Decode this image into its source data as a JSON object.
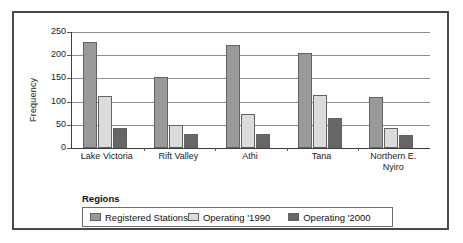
{
  "chart_data": {
    "type": "bar",
    "title": "",
    "subtitle": "",
    "xlabel": "Regions",
    "ylabel": "Frequency",
    "categories": [
      "Lake Victoria",
      "Rift Valley",
      "Athi",
      "Tana",
      "Northern E. Nyiro"
    ],
    "series": [
      {
        "name": "Registered Stations",
        "color": "#999999",
        "values": [
          228,
          152,
          222,
          204,
          111
        ]
      },
      {
        "name": "Operating '1990",
        "color": "#dcdcdc",
        "values": [
          113,
          49,
          73,
          114,
          43
        ]
      },
      {
        "name": "Operating '2000",
        "color": "#666666",
        "values": [
          44,
          31,
          30,
          64,
          27
        ]
      }
    ],
    "ylim": [
      0,
      250
    ],
    "yticks": [
      0,
      50,
      100,
      150,
      200,
      250
    ],
    "ytick_labels": [
      "0",
      "50",
      "100",
      "150",
      "200",
      "250"
    ],
    "grid": "horizontal",
    "legend_position": "bottom",
    "legend_entries": [
      "Registered Stations",
      "Operating '1990",
      "Operating '2000"
    ]
  },
  "axis": {
    "y_title": "Frequency",
    "x_title": "Regions"
  },
  "category_labels": [
    {
      "line1": "Lake Victoria",
      "line2": ""
    },
    {
      "line1": "Rift Valley",
      "line2": ""
    },
    {
      "line1": "Athi",
      "line2": ""
    },
    {
      "line1": "Tana",
      "line2": ""
    },
    {
      "line1": "Northern E.",
      "line2": "Nyiro"
    }
  ],
  "colors": {
    "series_1": "#999999",
    "series_2": "#dcdcdc",
    "series_3": "#666666",
    "frame": "#4a4a4a",
    "gridline": "#8c8c8c",
    "background": "#ffffff"
  }
}
